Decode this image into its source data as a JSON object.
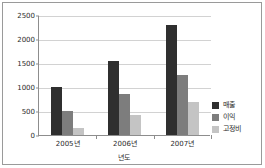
{
  "chart_data": {
    "type": "bar",
    "title": "",
    "subtitle": "",
    "xlabel": "년도",
    "ylabel": "",
    "categories": [
      "2005년",
      "2006년",
      "2007년"
    ],
    "series": [
      {
        "name": "매출",
        "color": "#2f2f2f",
        "values": [
          1000,
          1550,
          2290
        ]
      },
      {
        "name": "이익",
        "color": "#7d7d7d",
        "values": [
          500,
          850,
          1250
        ]
      },
      {
        "name": "고정비",
        "color": "#c4c4c4",
        "values": [
          150,
          420,
          690
        ]
      }
    ],
    "ylim": [
      0,
      2500
    ],
    "yticks": [
      0,
      500,
      1000,
      1500,
      2000,
      2500
    ],
    "ytick_labels": [
      "0",
      "500",
      "1000",
      "1500",
      "2000",
      "2500"
    ],
    "grid": true,
    "legend_position": "right"
  }
}
